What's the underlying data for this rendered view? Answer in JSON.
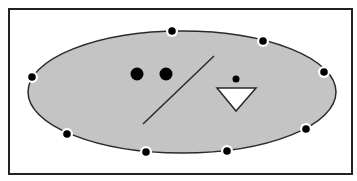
{
  "colors": {
    "background": "#ffffff",
    "frame": "#222222",
    "ellipse_fill": "#c4c4c4",
    "ellipse_stroke": "#2a2a2a",
    "dot": "#000000",
    "dot_halo": "#ffffff",
    "triangle_fill": "#ffffff",
    "line": "#2a2a2a"
  },
  "frame": {
    "x": 9,
    "y": 9,
    "width": 343,
    "height": 165
  },
  "ellipse": {
    "cx": 182,
    "cy": 92,
    "rx": 154,
    "ry": 61
  },
  "perimeter_dots": [
    {
      "cx": 172,
      "cy": 31
    },
    {
      "cx": 263,
      "cy": 41
    },
    {
      "cx": 324,
      "cy": 72
    },
    {
      "cx": 306,
      "cy": 129
    },
    {
      "cx": 227,
      "cy": 151
    },
    {
      "cx": 146,
      "cy": 152
    },
    {
      "cx": 67,
      "cy": 134
    },
    {
      "cx": 32,
      "cy": 77
    }
  ],
  "eye_dots": [
    {
      "cx": 137,
      "cy": 74,
      "r": 6.5
    },
    {
      "cx": 166,
      "cy": 74,
      "r": 6.5
    }
  ],
  "small_dot": {
    "cx": 236,
    "cy": 79,
    "r": 3.5
  },
  "diagonal_line": {
    "x1": 143,
    "y1": 124,
    "x2": 214,
    "y2": 56
  },
  "triangle": {
    "points": "217,88 256,88 236,111"
  }
}
